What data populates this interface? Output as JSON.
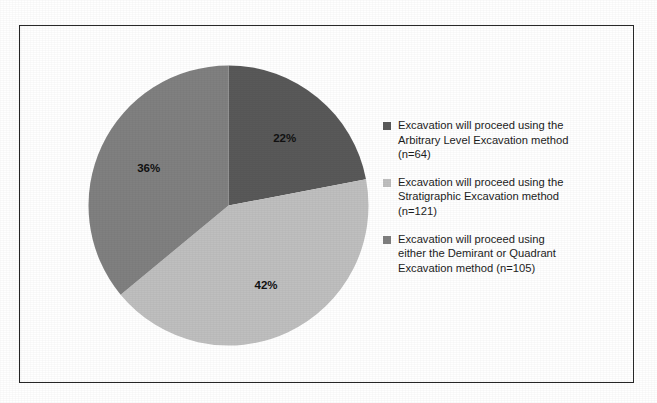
{
  "figure": {
    "border_color": "#2b2b2b",
    "background": "#ffffff"
  },
  "chart_data": {
    "type": "pie",
    "title": "",
    "subtitle": "",
    "xlabel": "",
    "ylabel": "",
    "legend_position": "right",
    "grid": false,
    "start_angle_deg": 0,
    "direction": "clockwise",
    "categories": [
      "Excavation will proceed using the Arbitrary Level Excavation method (n=64)",
      "Excavation will proceed using the Stratigraphic Excavation method (n=121)",
      "Excavation will proceed using either the Demirant or Quadrant Excavation method (n=105)"
    ],
    "values": [
      22,
      42,
      36
    ],
    "counts": [
      64,
      121,
      105
    ],
    "total_count": 290,
    "data_labels": [
      "22%",
      "42%",
      "36%"
    ],
    "colors": [
      "#595959",
      "#bfbfbf",
      "#808080"
    ],
    "slices": [
      {
        "label": "22%",
        "percent": 22,
        "count": 64,
        "color": "#595959",
        "legend_text": "Excavation will proceed using the\nArbitrary Level Excavation method\n(n=64)"
      },
      {
        "label": "42%",
        "percent": 42,
        "count": 121,
        "color": "#bfbfbf",
        "legend_text": "Excavation will proceed using the\nStratigraphic Excavation method\n(n=121)"
      },
      {
        "label": "36%",
        "percent": 36,
        "count": 105,
        "color": "#808080",
        "legend_text": "Excavation will proceed using\neither the Demirant or Quadrant\nExcavation method (n=105)"
      }
    ]
  },
  "legend": {
    "items": [
      {
        "text": "Excavation will proceed using the\nArbitrary Level Excavation method\n(n=64)",
        "color": "#595959"
      },
      {
        "text": "Excavation will proceed using the\nStratigraphic Excavation method\n(n=121)",
        "color": "#bfbfbf"
      },
      {
        "text": "Excavation will proceed using\neither the Demirant or Quadrant\nExcavation method (n=105)",
        "color": "#808080"
      }
    ]
  }
}
